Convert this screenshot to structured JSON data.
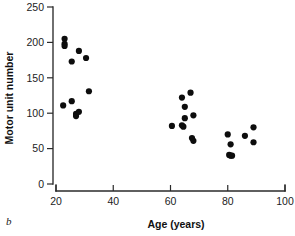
{
  "panel": {
    "letter": "b"
  },
  "axes": {
    "x": {
      "title": "Age (years)",
      "ticks": [
        20,
        40,
        60,
        80,
        100
      ],
      "tick_labels": [
        "20",
        "40",
        "60",
        "80",
        "100"
      ],
      "min": 20,
      "max": 100
    },
    "y": {
      "title": "Motor unit number",
      "ticks": [
        0,
        50,
        100,
        150,
        200,
        250
      ],
      "tick_labels": [
        "0",
        "50",
        "100",
        "150",
        "200",
        "250"
      ],
      "min": 0,
      "max": 250
    }
  },
  "chart_data": {
    "type": "scatter",
    "title": "",
    "subtitle": "",
    "xlabel": "Age (years)",
    "ylabel": "Motor unit number",
    "xlim": [
      20,
      100
    ],
    "ylim": [
      0,
      250
    ],
    "xticks": [
      20,
      40,
      60,
      80,
      100
    ],
    "yticks": [
      0,
      50,
      100,
      150,
      200,
      250
    ],
    "grid": false,
    "legend": false,
    "legend_position": "none",
    "marker": "filled-circle",
    "marker_color": "#0d0d0d",
    "series": [
      {
        "name": "Motor unit number",
        "points": [
          {
            "x": 23,
            "y": 205
          },
          {
            "x": 23,
            "y": 198
          },
          {
            "x": 23,
            "y": 195
          },
          {
            "x": 25.5,
            "y": 173
          },
          {
            "x": 28,
            "y": 188
          },
          {
            "x": 30.5,
            "y": 178
          },
          {
            "x": 31.5,
            "y": 131
          },
          {
            "x": 22.5,
            "y": 111
          },
          {
            "x": 25.5,
            "y": 117
          },
          {
            "x": 27,
            "y": 99
          },
          {
            "x": 27,
            "y": 96
          },
          {
            "x": 28,
            "y": 102
          },
          {
            "x": 60.5,
            "y": 82
          },
          {
            "x": 64,
            "y": 122
          },
          {
            "x": 64,
            "y": 83
          },
          {
            "x": 64.5,
            "y": 81
          },
          {
            "x": 65,
            "y": 109
          },
          {
            "x": 65,
            "y": 93
          },
          {
            "x": 67,
            "y": 129
          },
          {
            "x": 68,
            "y": 97
          },
          {
            "x": 67.5,
            "y": 65
          },
          {
            "x": 68,
            "y": 61
          },
          {
            "x": 80,
            "y": 70
          },
          {
            "x": 80.5,
            "y": 41
          },
          {
            "x": 81,
            "y": 40
          },
          {
            "x": 81.5,
            "y": 40
          },
          {
            "x": 81,
            "y": 56
          },
          {
            "x": 86,
            "y": 68
          },
          {
            "x": 89,
            "y": 80
          },
          {
            "x": 89,
            "y": 59
          }
        ]
      }
    ]
  },
  "colors": {
    "marker": "#0d0d0d",
    "axis": "#2a2a2a",
    "text": "#111111",
    "background": "#ffffff"
  }
}
